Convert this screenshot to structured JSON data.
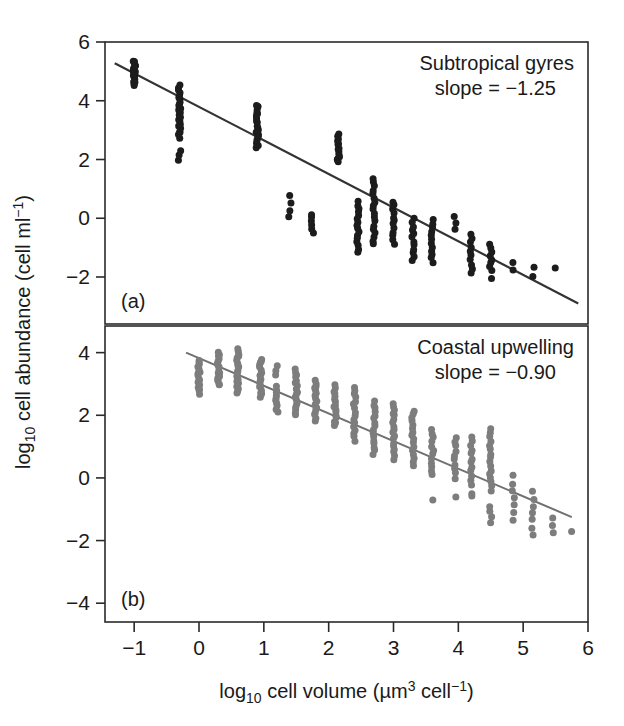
{
  "figure": {
    "title": "",
    "xlabel_parts": {
      "lead": "log",
      "sub": "10",
      "mid": " cell volume (µm",
      "sup": "3",
      "mid2": " cell",
      "sup2": "−1",
      "tail": ")"
    },
    "ylabel_parts": {
      "lead": "log",
      "sub": "10",
      "mid": " cell abundance (cell ml",
      "sup": "−1",
      "tail": ")"
    },
    "x_ticks": [
      "−1",
      "0",
      "1",
      "2",
      "3",
      "4",
      "5",
      "6"
    ],
    "x_tick_values": [
      -1,
      0,
      1,
      2,
      3,
      4,
      5,
      6
    ],
    "panel_a_label": "(a)",
    "panel_b_label": "(b)",
    "colors": {
      "axis": "#2a2a2a",
      "points_a": "#1c1c1c",
      "points_b": "#7d7d7d",
      "fit_a": "#333333",
      "fit_b": "#707070",
      "background": "#ffffff"
    }
  },
  "chart_data": [
    {
      "id": "panel-a",
      "type": "scatter",
      "panel": "(a)",
      "title": "Subtropical gyres",
      "annotation_slope": "slope = −1.25",
      "slope": -1.25,
      "intercept": 3.95,
      "xlabel": "log10 cell volume (µm3 cell−1)",
      "ylabel": "log10 cell abundance (cell ml−1)",
      "xlim": [
        -1.45,
        6.0
      ],
      "ylim": [
        -3.6,
        6.0
      ],
      "y_ticks": [
        "6",
        "4",
        "2",
        "0",
        "−2"
      ],
      "y_tick_values": [
        6,
        4,
        2,
        0,
        -2
      ],
      "grid": false,
      "legend": "none",
      "fit_line": {
        "x_start": -1.3,
        "y_start": 5.28,
        "x_end": 5.85,
        "y_end": -2.9
      },
      "columns": [
        {
          "x": -1.0,
          "y_min": 4.55,
          "y_max": 5.35,
          "n": 22
        },
        {
          "x": -0.3,
          "y_min": 2.75,
          "y_max": 4.5,
          "n": 24
        },
        {
          "x": -0.3,
          "y_min": 1.95,
          "y_max": 2.3,
          "n": 3
        },
        {
          "x": 0.9,
          "y_min": 2.4,
          "y_max": 3.85,
          "n": 20
        },
        {
          "x": 1.4,
          "y_min": 0.05,
          "y_max": 0.75,
          "n": 4
        },
        {
          "x": 1.75,
          "y_min": -0.5,
          "y_max": 0.15,
          "n": 6
        },
        {
          "x": 2.15,
          "y_min": 1.9,
          "y_max": 2.85,
          "n": 14
        },
        {
          "x": 2.45,
          "y_min": -1.15,
          "y_max": 0.55,
          "n": 16
        },
        {
          "x": 2.7,
          "y_min": -0.9,
          "y_max": 1.35,
          "n": 18
        },
        {
          "x": 3.0,
          "y_min": -0.85,
          "y_max": 0.55,
          "n": 12
        },
        {
          "x": 3.3,
          "y_min": -1.45,
          "y_max": 0.0,
          "n": 12
        },
        {
          "x": 3.6,
          "y_min": -1.5,
          "y_max": -0.05,
          "n": 12
        },
        {
          "x": 3.95,
          "y_min": -0.4,
          "y_max": 0.05,
          "n": 3
        },
        {
          "x": 4.2,
          "y_min": -1.85,
          "y_max": -0.55,
          "n": 10
        },
        {
          "x": 4.5,
          "y_min": -1.8,
          "y_max": -0.85,
          "n": 8
        },
        {
          "x": 4.5,
          "y_min": -2.1,
          "y_max": -2.0,
          "n": 1
        },
        {
          "x": 4.85,
          "y_min": -1.75,
          "y_max": -1.5,
          "n": 2
        },
        {
          "x": 5.15,
          "y_min": -2.0,
          "y_max": -1.7,
          "n": 2
        },
        {
          "x": 5.5,
          "y_min": -1.7,
          "y_max": -1.7,
          "n": 1
        }
      ]
    },
    {
      "id": "panel-b",
      "type": "scatter",
      "panel": "(b)",
      "title": "Coastal upwelling",
      "annotation_slope": "slope = −0.90",
      "slope": -0.9,
      "intercept": 3.82,
      "xlabel": "log10 cell volume (µm3 cell−1)",
      "ylabel": "log10 cell abundance (cell ml−1)",
      "xlim": [
        -1.45,
        6.0
      ],
      "ylim": [
        -4.6,
        4.85
      ],
      "y_ticks": [
        "4",
        "2",
        "0",
        "−2",
        "−4"
      ],
      "y_tick_values": [
        4,
        2,
        0,
        -2,
        -4
      ],
      "grid": false,
      "legend": "none",
      "fit_line": {
        "x_start": -0.2,
        "y_start": 4.0,
        "x_end": 5.75,
        "y_end": -1.25
      },
      "columns": [
        {
          "x": 0.0,
          "y_min": 2.7,
          "y_max": 3.75,
          "n": 16
        },
        {
          "x": 0.3,
          "y_min": 2.95,
          "y_max": 4.0,
          "n": 18
        },
        {
          "x": 0.6,
          "y_min": 2.7,
          "y_max": 4.1,
          "n": 20
        },
        {
          "x": 0.95,
          "y_min": 2.6,
          "y_max": 3.8,
          "n": 18
        },
        {
          "x": 1.2,
          "y_min": 3.3,
          "y_max": 3.6,
          "n": 3
        },
        {
          "x": 1.2,
          "y_min": 2.1,
          "y_max": 2.9,
          "n": 10
        },
        {
          "x": 1.5,
          "y_min": 2.0,
          "y_max": 3.45,
          "n": 18
        },
        {
          "x": 1.8,
          "y_min": 1.85,
          "y_max": 3.1,
          "n": 16
        },
        {
          "x": 2.1,
          "y_min": 1.65,
          "y_max": 2.95,
          "n": 16
        },
        {
          "x": 2.4,
          "y_min": 1.2,
          "y_max": 2.9,
          "n": 16
        },
        {
          "x": 2.7,
          "y_min": 0.75,
          "y_max": 2.45,
          "n": 16
        },
        {
          "x": 3.0,
          "y_min": 0.6,
          "y_max": 2.4,
          "n": 18
        },
        {
          "x": 3.3,
          "y_min": 0.4,
          "y_max": 2.15,
          "n": 16
        },
        {
          "x": 3.6,
          "y_min": 0.1,
          "y_max": 1.55,
          "n": 12
        },
        {
          "x": 3.6,
          "y_min": -0.7,
          "y_max": -0.7,
          "n": 1
        },
        {
          "x": 3.95,
          "y_min": 0.0,
          "y_max": 1.3,
          "n": 10
        },
        {
          "x": 3.95,
          "y_min": -0.6,
          "y_max": -0.55,
          "n": 1
        },
        {
          "x": 4.2,
          "y_min": -0.2,
          "y_max": 1.3,
          "n": 12
        },
        {
          "x": 4.2,
          "y_min": -0.6,
          "y_max": -0.5,
          "n": 2
        },
        {
          "x": 4.5,
          "y_min": -0.4,
          "y_max": 1.55,
          "n": 16
        },
        {
          "x": 4.5,
          "y_min": -1.4,
          "y_max": -0.9,
          "n": 4
        },
        {
          "x": 4.85,
          "y_min": -1.35,
          "y_max": 0.05,
          "n": 7
        },
        {
          "x": 5.15,
          "y_min": -1.8,
          "y_max": -0.45,
          "n": 7
        },
        {
          "x": 5.45,
          "y_min": -1.75,
          "y_max": -1.25,
          "n": 3
        },
        {
          "x": 5.75,
          "y_min": -1.7,
          "y_max": -1.7,
          "n": 1
        }
      ]
    }
  ]
}
